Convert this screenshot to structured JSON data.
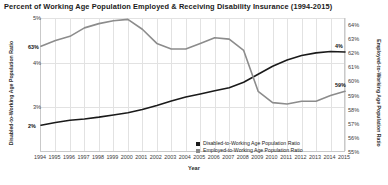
{
  "chart_data": {
    "type": "line",
    "title": "Percent of Working Age Population Employed & Receiving Disability Insurance (1994-2015)",
    "xlabel": "Year",
    "ylabel_left": "Disabled-to-Working Age Population Ratio",
    "ylabel_right": "Employed-to-Working Age Population Ratio",
    "grid": true,
    "legend_position": "inside-bottom-right",
    "categories": [
      1994,
      1995,
      1996,
      1997,
      1998,
      1999,
      2000,
      2001,
      2002,
      2003,
      2004,
      2005,
      2006,
      2007,
      2008,
      2009,
      2010,
      2011,
      2012,
      2013,
      2014,
      2015
    ],
    "xticklabels": [
      "1994",
      "1995",
      "1996",
      "1997",
      "1998",
      "1999",
      "2000",
      "2001",
      "2002",
      "2003",
      "2004",
      "2005",
      "2006",
      "2007",
      "2008",
      "2009",
      "2010",
      "2011",
      "2012",
      "2013",
      "2014",
      "2015"
    ],
    "left_axis": {
      "ylim": [
        2.0,
        5.0
      ],
      "ticks": [
        5,
        4,
        3
      ],
      "ticklabels": [
        "5%",
        "4%",
        "3%"
      ],
      "unit": "%"
    },
    "right_axis": {
      "ylim": [
        55.0,
        64.5
      ],
      "ticks": [
        64,
        63,
        62,
        61,
        60,
        59,
        58,
        57,
        56,
        55
      ],
      "ticklabels": [
        "64%",
        "63%",
        "62%",
        "61%",
        "60%",
        "59%",
        "58%",
        "57%",
        "56%",
        "55%"
      ],
      "unit": "%"
    },
    "series": [
      {
        "name": "Disabled-to-Working Age Population Ratio",
        "axis": "left",
        "color": "#1a1a1a",
        "values": [
          2.6,
          2.66,
          2.71,
          2.74,
          2.78,
          2.83,
          2.88,
          2.95,
          3.04,
          3.14,
          3.23,
          3.3,
          3.37,
          3.44,
          3.56,
          3.74,
          3.92,
          4.06,
          4.16,
          4.22,
          4.25,
          4.24
        ],
        "start_label": "2%",
        "end_label": "4%"
      },
      {
        "name": "Employed-to-Working Age Population Ratio",
        "axis": "right",
        "color": "#8c8c8c",
        "values": [
          62.5,
          62.9,
          63.2,
          63.8,
          64.1,
          64.3,
          64.4,
          63.7,
          62.7,
          62.3,
          62.3,
          62.7,
          63.1,
          63.0,
          62.2,
          59.3,
          58.5,
          58.4,
          58.6,
          58.6,
          59.0,
          59.3
        ],
        "start_label": "63%",
        "end_label": "59%"
      }
    ]
  },
  "legend": {
    "items": [
      {
        "label": "Disabled-to-Working Age Population Ratio",
        "color": "#1a1a1a"
      },
      {
        "label": "Employed-to-Working Age Population Ratio",
        "color": "#8c8c8c"
      }
    ]
  }
}
